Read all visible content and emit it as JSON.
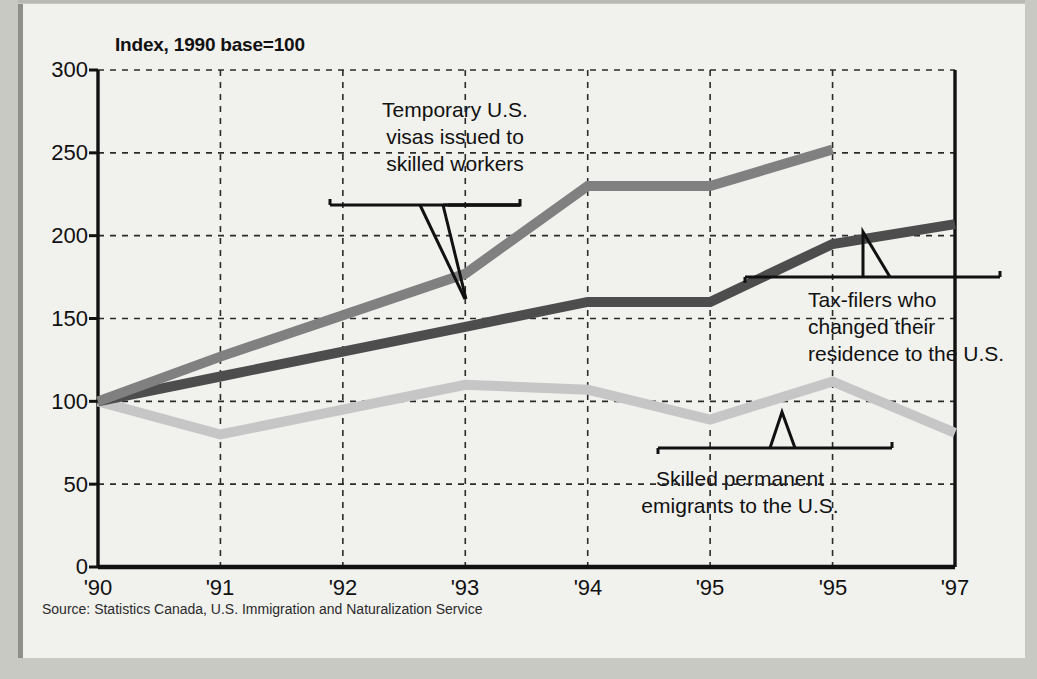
{
  "chart_data": {
    "type": "line",
    "title": "",
    "subtitle": "",
    "axis_note": "Index, 1990 base=100",
    "xlabel": "",
    "ylabel": "",
    "categories": [
      "'90",
      "'91",
      "'92",
      "'93",
      "'94",
      "'95",
      "'95",
      "'97"
    ],
    "ylim": [
      0,
      300
    ],
    "yticks": [
      0,
      50,
      100,
      150,
      200,
      250,
      300
    ],
    "grid": true,
    "legend": "annotations-inline",
    "series": [
      {
        "name": "Temporary U.S. visas issued to skilled workers",
        "color": "#808080",
        "values": [
          100,
          127,
          152,
          177,
          230,
          230,
          252,
          null
        ]
      },
      {
        "name": "Tax-filers who changed their residence to the U.S.",
        "color": "#4d4d4d",
        "values": [
          100,
          115,
          130,
          145,
          160,
          160,
          195,
          207
        ]
      },
      {
        "name": "Skilled permanent emigrants to the U.S.",
        "color": "#c6c6c6",
        "values": [
          100,
          80,
          95,
          110,
          107,
          89,
          112,
          81
        ]
      }
    ],
    "annotations": [
      {
        "id": "temporary-visas",
        "text_lines": [
          "Temporary U.S.",
          "visas issued to",
          "skilled workers"
        ]
      },
      {
        "id": "tax-filers",
        "text_lines": [
          "Tax-filers who",
          "changed their",
          "residence to the U.S."
        ]
      },
      {
        "id": "skilled-emigrants",
        "text_lines": [
          "Skilled permanent",
          "emigrants to the U.S."
        ]
      }
    ],
    "source": "Source: Statistics Canada, U.S. Immigration and Naturalization Service"
  },
  "axis": {
    "note": "Index, 1990 base=100",
    "yticks": [
      "300",
      "250",
      "200",
      "150",
      "100",
      "50",
      "0"
    ],
    "xticks": [
      "'90",
      "'91",
      "'92",
      "'93",
      "'94",
      "'95",
      "'95",
      "'97"
    ]
  },
  "annotations": {
    "temporary": {
      "line1": "Temporary U.S.",
      "line2": "visas issued to",
      "line3": "skilled workers"
    },
    "taxfilers": {
      "line1": "Tax-filers who",
      "line2": "changed their",
      "line3": "residence to the U.S."
    },
    "emigrants": {
      "line1": "Skilled permanent",
      "line2": "emigrants to the U.S."
    }
  },
  "footer": {
    "source": "Source: Statistics Canada, U.S. Immigration and Naturalization Service"
  },
  "colors": {
    "series_temporary": "#808080",
    "series_taxfilers": "#4d4d4d",
    "series_emigrants": "#c6c6c6",
    "background": "#f1f1ee",
    "page": "#c9c9c4",
    "ink": "#111111"
  }
}
